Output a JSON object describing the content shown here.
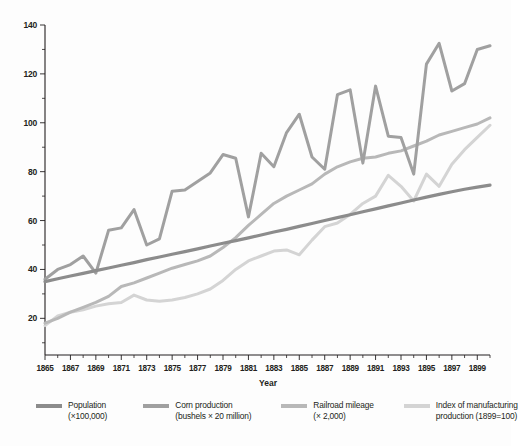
{
  "chart_data": {
    "type": "line",
    "title": "",
    "xlabel": "Year",
    "ylabel": "",
    "xlim": [
      1865,
      1900
    ],
    "ylim": [
      5,
      140
    ],
    "yticks": [
      20,
      40,
      60,
      80,
      100,
      120,
      140
    ],
    "y_minor_step": 10,
    "xticks": [
      1865,
      1867,
      1869,
      1871,
      1873,
      1875,
      1877,
      1879,
      1881,
      1883,
      1885,
      1887,
      1889,
      1891,
      1893,
      1895,
      1897,
      1899
    ],
    "x_minor_step": 1,
    "grid": false,
    "legend_position": "below",
    "x": [
      1865,
      1866,
      1867,
      1868,
      1869,
      1870,
      1871,
      1872,
      1873,
      1874,
      1875,
      1876,
      1877,
      1878,
      1879,
      1880,
      1881,
      1882,
      1883,
      1884,
      1885,
      1886,
      1887,
      1888,
      1889,
      1890,
      1891,
      1892,
      1893,
      1894,
      1895,
      1896,
      1897,
      1898,
      1899,
      1900
    ],
    "series": [
      {
        "name": "Population",
        "units": "(×100,000)",
        "color": "#8c8c8c",
        "width": 3.2,
        "values": [
          35.0,
          36.2,
          37.3,
          38.4,
          39.5,
          40.6,
          41.7,
          42.8,
          44.0,
          45.1,
          46.2,
          47.3,
          48.4,
          49.6,
          50.7,
          51.8,
          52.9,
          54.1,
          55.3,
          56.4,
          57.6,
          58.8,
          60.0,
          61.2,
          62.4,
          63.6,
          64.8,
          66.0,
          67.2,
          68.4,
          69.6,
          70.7,
          71.8,
          72.8,
          73.7,
          74.5
        ]
      },
      {
        "name": "Corn production",
        "units": "(bushels × 20 million)",
        "color": "#a0a0a0",
        "width": 3.0,
        "values": [
          36.0,
          40.0,
          42.0,
          45.5,
          38.5,
          56.0,
          57.0,
          64.5,
          50.0,
          52.5,
          72.0,
          72.5,
          76.0,
          79.5,
          87.0,
          85.5,
          61.5,
          87.5,
          82.0,
          96.0,
          103.5,
          86.0,
          81.0,
          111.5,
          113.5,
          83.5,
          115.0,
          94.5,
          94.0,
          79.0,
          124.0,
          132.5,
          113.0,
          116.0,
          130.0,
          131.5
        ]
      },
      {
        "name": "Railroad mileage",
        "units": "(× 2,000)",
        "color": "#b8b8b8",
        "width": 3.0,
        "values": [
          18.0,
          20.0,
          22.5,
          24.5,
          26.5,
          29.0,
          33.0,
          34.5,
          36.5,
          38.5,
          40.5,
          42.0,
          43.5,
          45.5,
          49.0,
          53.0,
          58.0,
          62.5,
          67.0,
          70.0,
          72.5,
          75.0,
          79.0,
          82.0,
          84.0,
          85.5,
          86.0,
          87.5,
          88.5,
          90.5,
          92.5,
          95.0,
          96.5,
          98.0,
          99.5,
          102.0
        ]
      },
      {
        "name": "Index of manufacturing production",
        "units": "(1899=100)",
        "color": "#d4d4d4",
        "width": 3.0,
        "values": [
          17.0,
          21.0,
          22.5,
          23.5,
          25.0,
          26.0,
          26.5,
          29.5,
          27.5,
          27.0,
          27.5,
          28.5,
          30.0,
          32.0,
          35.5,
          40.0,
          43.5,
          45.5,
          47.5,
          48.0,
          46.0,
          52.0,
          57.5,
          59.0,
          62.5,
          67.0,
          70.0,
          78.5,
          74.0,
          68.0,
          79.0,
          74.0,
          83.0,
          89.0,
          94.0,
          99.0
        ]
      }
    ]
  },
  "axes": {
    "x_axis_title": "Year",
    "y_tick_labels": [
      "20",
      "40",
      "60",
      "80",
      "100",
      "120",
      "140"
    ],
    "x_tick_labels": [
      "1865",
      "1867",
      "1869",
      "1871",
      "1873",
      "1875",
      "1877",
      "1879",
      "1881",
      "1883",
      "1885",
      "1887",
      "1889",
      "1891",
      "1893",
      "1895",
      "1897",
      "1899"
    ]
  },
  "legend": {
    "items": [
      {
        "label": "Population",
        "sublabel": "(×100,000)",
        "color": "#8c8c8c"
      },
      {
        "label": "Corn production",
        "sublabel": "(bushels × 20 million)",
        "color": "#a0a0a0"
      },
      {
        "label": "Railroad mileage",
        "sublabel": "(× 2,000)",
        "color": "#b8b8b8"
      },
      {
        "label": "Index of manufacturing",
        "sublabel": "production (1899=100)",
        "color": "#d4d4d4"
      }
    ]
  }
}
